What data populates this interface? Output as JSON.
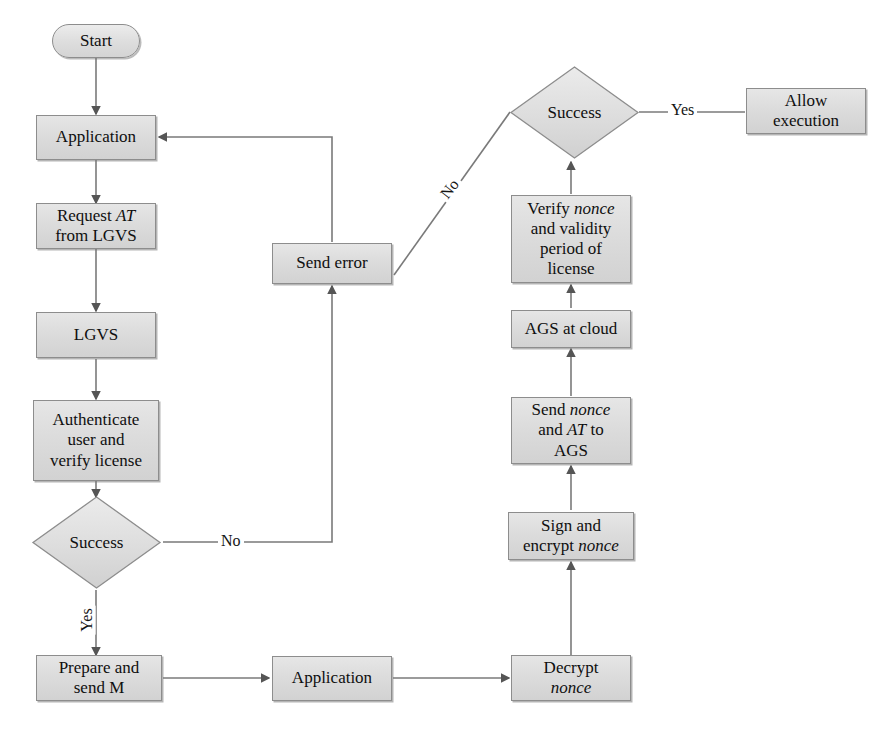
{
  "diagram": {
    "style": {
      "node_fill": "#dcdcdc",
      "node_border": "#8d8d8d",
      "edge_color": "#6e6e6e",
      "text_color": "#0f0f0f",
      "background": "#ffffff"
    },
    "nodes": [
      {
        "id": "start",
        "shape": "terminator",
        "label": "Start"
      },
      {
        "id": "application1",
        "shape": "process",
        "label": "Application"
      },
      {
        "id": "request_at",
        "shape": "process",
        "label": "Request AT from LGVS",
        "line1": "Request ",
        "em1": "AT",
        "line2": "from LGVS"
      },
      {
        "id": "lgvs",
        "shape": "process",
        "label": "LGVS"
      },
      {
        "id": "authenticate",
        "shape": "process",
        "label": "Authenticate user and verify license",
        "line1": "Authenticate",
        "line2": "user and",
        "line3": "verify license"
      },
      {
        "id": "success1",
        "shape": "decision",
        "label": "Success"
      },
      {
        "id": "prepare",
        "shape": "process",
        "label": "Prepare and send M",
        "line1": "Prepare and",
        "line2": "send M"
      },
      {
        "id": "application2",
        "shape": "process",
        "label": "Application"
      },
      {
        "id": "decrypt",
        "shape": "process",
        "label": "Decrypt nonce",
        "line1": "Decrypt",
        "em1": "nonce"
      },
      {
        "id": "sign",
        "shape": "process",
        "label": "Sign and encrypt nonce",
        "line1": "Sign and",
        "line2": "encrypt ",
        "em2": "nonce"
      },
      {
        "id": "send_nonce",
        "shape": "process",
        "label": "Send nonce and AT to AGS",
        "line1": "Send ",
        "em1": "nonce",
        "line2a": "and ",
        "em2": "AT",
        "line2b": " to",
        "line3": "AGS"
      },
      {
        "id": "ags_cloud",
        "shape": "process",
        "label": "AGS at cloud"
      },
      {
        "id": "verify",
        "shape": "process",
        "label": "Verify nonce and validity period of license",
        "line1": "Verify ",
        "em1": "nonce",
        "line2": "and validity",
        "line3": "period of",
        "line4": "license"
      },
      {
        "id": "success2",
        "shape": "decision",
        "label": "Success"
      },
      {
        "id": "allow",
        "shape": "process",
        "label": "Allow execution",
        "line1": "Allow",
        "line2": "execution"
      },
      {
        "id": "send_error",
        "shape": "process",
        "label": "Send error"
      }
    ],
    "edge_labels": {
      "no_left": "No",
      "no_diagonal": "No",
      "yes_left": "Yes",
      "yes_right": "Yes"
    },
    "edges": [
      {
        "from": "start",
        "to": "application1",
        "label": ""
      },
      {
        "from": "application1",
        "to": "request_at",
        "label": ""
      },
      {
        "from": "request_at",
        "to": "lgvs",
        "label": ""
      },
      {
        "from": "lgvs",
        "to": "authenticate",
        "label": ""
      },
      {
        "from": "authenticate",
        "to": "success1",
        "label": ""
      },
      {
        "from": "success1",
        "to": "send_error",
        "label": "No"
      },
      {
        "from": "success1",
        "to": "prepare",
        "label": "Yes"
      },
      {
        "from": "send_error",
        "to": "application1",
        "label": ""
      },
      {
        "from": "prepare",
        "to": "application2",
        "label": ""
      },
      {
        "from": "application2",
        "to": "decrypt",
        "label": ""
      },
      {
        "from": "decrypt",
        "to": "sign",
        "label": ""
      },
      {
        "from": "sign",
        "to": "send_nonce",
        "label": ""
      },
      {
        "from": "send_nonce",
        "to": "ags_cloud",
        "label": ""
      },
      {
        "from": "ags_cloud",
        "to": "verify",
        "label": ""
      },
      {
        "from": "verify",
        "to": "success2",
        "label": ""
      },
      {
        "from": "success2",
        "to": "allow",
        "label": "Yes"
      },
      {
        "from": "success2",
        "to": "send_error",
        "label": "No"
      }
    ]
  }
}
